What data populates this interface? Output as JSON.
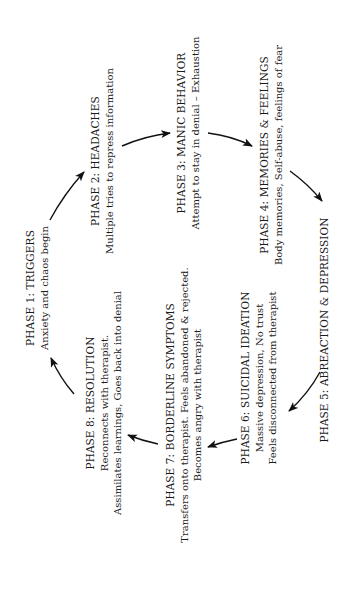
{
  "diagram": {
    "type": "cycle",
    "orientation": "rotated-90-ccw",
    "phases": [
      {
        "id": 1,
        "title": "PHASE 1:  TRIGGERS",
        "lines": [
          "Anxiety and chaos begin"
        ]
      },
      {
        "id": 2,
        "title": "PHASE 2:  HEADACHES",
        "lines": [
          "Multiple tries to repress information"
        ]
      },
      {
        "id": 3,
        "title": "PHASE 3:  MANIC BEHAVIOR",
        "lines": [
          "Attempt to stay in denial – Exhaustion"
        ]
      },
      {
        "id": 4,
        "title": "PHASE 4:  MEMORIES & FEELINGS",
        "lines": [
          "Body memories, Self-abuse,  feelings of fear"
        ]
      },
      {
        "id": 5,
        "title": "PHASE 5:  ABREACTION & DEPRESSION",
        "lines": []
      },
      {
        "id": 6,
        "title": "PHASE 6:  SUICIDAL IDEATION",
        "lines": [
          "Massive depression, No trust",
          "Feels disconnected from therapist"
        ]
      },
      {
        "id": 7,
        "title": "PHASE 7:  BORDERLINE SYMPTOMS",
        "lines": [
          "Transfers onto therapist. Feels abandoned & rejected.",
          "Becomes angry with therapist"
        ]
      },
      {
        "id": 8,
        "title": "PHASE 8:  RESOLUTION",
        "lines": [
          "Reconnects with therapist.",
          "Assimilates learnings, Goes back into denial"
        ]
      }
    ],
    "edges": [
      [
        "PHASE 1",
        "PHASE 2"
      ],
      [
        "PHASE 2",
        "PHASE 3"
      ],
      [
        "PHASE 3",
        "PHASE 4"
      ],
      [
        "PHASE 4",
        "PHASE 5"
      ],
      [
        "PHASE 5",
        "PHASE 6"
      ],
      [
        "PHASE 6",
        "PHASE 7"
      ],
      [
        "PHASE 7",
        "PHASE 8"
      ],
      [
        "PHASE 8",
        "PHASE 1"
      ]
    ],
    "colors": {
      "text": "#1a1a1a",
      "arrow": "#111111",
      "background": "#ffffff"
    }
  }
}
